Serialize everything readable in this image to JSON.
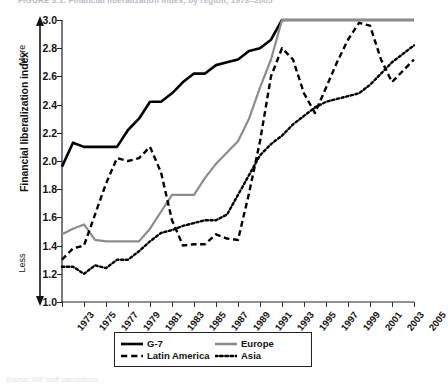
{
  "figure": {
    "title": "FIGURE 3.1.  Financial liberalization index, by region, 1973–2005",
    "caption": "Source: IMF staff calculations."
  },
  "axes": {
    "ylabel": "Financial liberalization index",
    "y_top_cap": "More",
    "y_bottom_cap": "Less",
    "xlabel": ""
  },
  "legend": {
    "items": [
      {
        "label": "G-7",
        "style": "solid",
        "color": "#000000"
      },
      {
        "label": "Europe",
        "style": "solid",
        "color": "#8c8c8c"
      },
      {
        "label": "Latin America",
        "style": "dashed",
        "color": "#000000"
      },
      {
        "label": "Asia",
        "style": "dotted",
        "color": "#000000"
      }
    ]
  },
  "chart_data": {
    "type": "line",
    "title": "Financial liberalization index, by region, 1973–2005",
    "xlabel": "",
    "ylabel": "Financial liberalization index",
    "xlim": [
      1973,
      2005
    ],
    "ylim": [
      1.0,
      3.0
    ],
    "yticks": [
      1.0,
      1.2,
      1.4,
      1.6,
      1.8,
      2.0,
      2.2,
      2.4,
      2.6,
      2.8,
      3.0
    ],
    "ytick_labels": [
      "1.0",
      "1.2",
      "1.4",
      "1.6",
      "1.8",
      "2.0",
      "2.2",
      "2.4",
      "2.6",
      "2.8",
      "3.0"
    ],
    "xticks": [
      1973,
      1975,
      1977,
      1979,
      1981,
      1983,
      1985,
      1987,
      1989,
      1991,
      1993,
      1995,
      1997,
      1999,
      2001,
      2003,
      2005
    ],
    "xtick_labels": [
      "1973",
      "1975",
      "1977",
      "1979",
      "1981",
      "1983",
      "1985",
      "1987",
      "1989",
      "1991",
      "1993",
      "1995",
      "1997",
      "1999",
      "2001",
      "2003",
      "2005"
    ],
    "grid": false,
    "legend_position": "bottom",
    "axis_annotations": {
      "y_high": "More",
      "y_low": "Less"
    },
    "x": [
      1973,
      1974,
      1975,
      1976,
      1977,
      1978,
      1979,
      1980,
      1981,
      1982,
      1983,
      1984,
      1985,
      1986,
      1987,
      1988,
      1989,
      1990,
      1991,
      1992,
      1993,
      1994,
      1995,
      1996,
      1997,
      1998,
      1999,
      2000,
      2001,
      2002,
      2003,
      2004,
      2005
    ],
    "series": [
      {
        "name": "G-7",
        "style": "solid",
        "color": "#000000",
        "values": [
          1.96,
          2.13,
          2.1,
          2.1,
          2.1,
          2.1,
          2.22,
          2.3,
          2.42,
          2.42,
          2.48,
          2.56,
          2.62,
          2.62,
          2.68,
          2.7,
          2.72,
          2.78,
          2.8,
          2.86,
          3.0,
          3.0,
          3.0,
          3.0,
          3.0,
          3.0,
          3.0,
          3.0,
          3.0,
          3.0,
          3.0,
          3.0,
          3.0
        ]
      },
      {
        "name": "Europe",
        "style": "solid",
        "color": "#8c8c8c",
        "values": [
          1.48,
          1.52,
          1.55,
          1.44,
          1.43,
          1.43,
          1.43,
          1.43,
          1.52,
          1.64,
          1.76,
          1.76,
          1.76,
          1.88,
          1.98,
          2.06,
          2.14,
          2.3,
          2.52,
          2.72,
          3.0,
          3.0,
          3.0,
          3.0,
          3.0,
          3.0,
          3.0,
          3.0,
          3.0,
          3.0,
          3.0,
          3.0,
          3.0
        ]
      },
      {
        "name": "Latin America",
        "style": "dashed",
        "color": "#000000",
        "values": [
          1.3,
          1.38,
          1.4,
          1.62,
          1.84,
          2.02,
          2.0,
          2.02,
          2.1,
          1.92,
          1.58,
          1.4,
          1.41,
          1.41,
          1.48,
          1.45,
          1.44,
          1.77,
          2.14,
          2.6,
          2.8,
          2.72,
          2.48,
          2.34,
          2.52,
          2.7,
          2.86,
          2.98,
          2.96,
          2.72,
          2.56,
          2.64,
          2.72
        ]
      },
      {
        "name": "Asia",
        "style": "dotted",
        "color": "#000000",
        "values": [
          1.25,
          1.25,
          1.2,
          1.26,
          1.24,
          1.3,
          1.3,
          1.36,
          1.43,
          1.49,
          1.51,
          1.54,
          1.56,
          1.58,
          1.58,
          1.62,
          1.76,
          1.9,
          2.04,
          2.12,
          2.18,
          2.26,
          2.32,
          2.38,
          2.42,
          2.44,
          2.46,
          2.48,
          2.54,
          2.62,
          2.7,
          2.76,
          2.82
        ]
      }
    ]
  }
}
